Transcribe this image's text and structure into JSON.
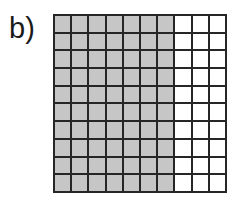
{
  "label": "b)",
  "grid": {
    "rows": 10,
    "columns": 10,
    "shaded_columns": 7,
    "unshaded_columns": 3,
    "shaded_cells": 70,
    "total_cells": 100,
    "shaded_color": "#c6c6c6",
    "unshaded_color": "#ffffff",
    "line_color": "#262626"
  }
}
